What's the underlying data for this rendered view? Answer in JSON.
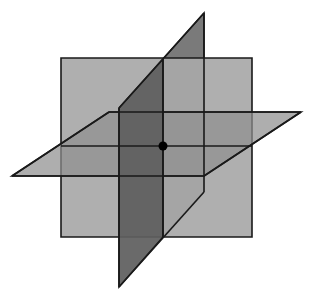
{
  "diagram": {
    "canvas": {
      "width": 313,
      "height": 292,
      "background": "#ffffff"
    },
    "stroke": {
      "color": "#1a1a1a",
      "width": 1.6
    },
    "shapes": [
      {
        "name": "dark-plane-back-part",
        "points": "163,59 204,13 204,192 163,237",
        "fill": "#7a7a7a",
        "opacity": 1
      },
      {
        "name": "vertical-plane-rect",
        "points": "61,58 252,58 252,237 61,237",
        "fill": "#a8a8a8",
        "opacity": 0.92
      },
      {
        "name": "horizontal-plane",
        "points": "12,176 204,176 301,112 109,112",
        "fill": "#8f8f8f",
        "opacity": 0.72
      },
      {
        "name": "dark-plane-front-part",
        "points": "119,108 163,59 163,237 119,287",
        "fill": "#5f5f5f",
        "opacity": 0.93
      }
    ],
    "lines": [
      {
        "name": "intersection-line-vertical",
        "x1": 163,
        "y1": 59,
        "x2": 163,
        "y2": 237
      },
      {
        "name": "intersection-line-horizontal",
        "x1": 61,
        "y1": 146,
        "x2": 252,
        "y2": 146
      },
      {
        "name": "horizontal-plane-front-edge",
        "x1": 12,
        "y1": 176,
        "x2": 204,
        "y2": 176
      },
      {
        "name": "horizontal-plane-back-edge",
        "x1": 109,
        "y1": 112,
        "x2": 301,
        "y2": 112
      },
      {
        "name": "horizontal-plane-left-edge",
        "x1": 12,
        "y1": 176,
        "x2": 109,
        "y2": 112
      },
      {
        "name": "horizontal-plane-right-edge",
        "x1": 204,
        "y1": 176,
        "x2": 301,
        "y2": 112
      },
      {
        "name": "dark-plane-top-diagonal",
        "x1": 119,
        "y1": 108,
        "x2": 204,
        "y2": 13
      },
      {
        "name": "dark-plane-right-edge",
        "x1": 204,
        "y1": 13,
        "x2": 204,
        "y2": 192
      },
      {
        "name": "dark-plane-bottom-diagonal",
        "x1": 204,
        "y1": 192,
        "x2": 119,
        "y2": 287
      },
      {
        "name": "dark-plane-left-edge",
        "x1": 119,
        "y1": 108,
        "x2": 119,
        "y2": 287
      }
    ],
    "point": {
      "name": "intersection-point",
      "cx": 163,
      "cy": 146,
      "r": 4.5,
      "fill": "#000000"
    }
  }
}
